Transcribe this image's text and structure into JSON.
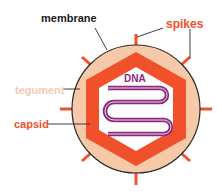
{
  "labels": {
    "membrane": "membrane",
    "spikes": "spikes",
    "tegument": "tegument",
    "capsid": "capsid",
    "dna": "DNA"
  },
  "colors": {
    "membrane_label": "#1a1a1a",
    "spikes": "#f0502a",
    "tegument_fill": "#f6c9a8",
    "tegument_label": "#f3cdb3",
    "capsid": "#f0502a",
    "dna": "#8c2b7e",
    "membrane_line": "#2a2a2a"
  }
}
